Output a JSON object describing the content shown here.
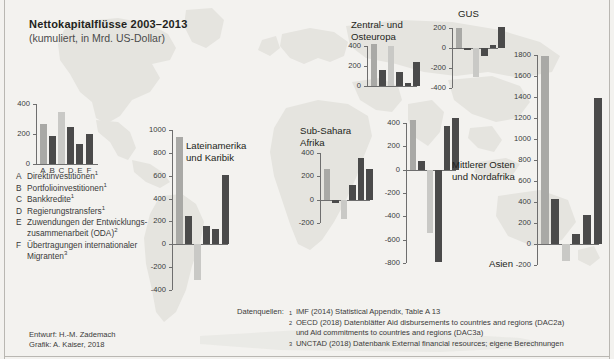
{
  "title": "Nettokapitalflüsse 2003–2013",
  "subtitle": "(kumuliert, in Mrd. US-Dollar)",
  "colors": {
    "bar_gray": "#a9a9a6",
    "bar_dark": "#4a4a4a",
    "bar_light": "#c9c9c6",
    "axis": "#6e6e6e",
    "background": "#f3f2ef",
    "map": "#e4e3de",
    "text": "#231f20"
  },
  "legend": {
    "categories": [
      "A",
      "B",
      "C",
      "D",
      "E",
      "F"
    ],
    "items": [
      {
        "key": "A",
        "label": "Direktinvestitionen",
        "note": "1"
      },
      {
        "key": "B",
        "label": "Portfolioinvestitionen",
        "note": "1"
      },
      {
        "key": "C",
        "label": "Bankkredite",
        "note": "1"
      },
      {
        "key": "D",
        "label": "Regierungstransfers",
        "note": "1"
      },
      {
        "key": "E",
        "label": "Zuwendungen der Entwicklungs-",
        "label2": "zusammenarbeit (ODA)",
        "note": "2"
      },
      {
        "key": "F",
        "label": "Übertragungen internationaler",
        "label2": "Migranten",
        "note": "3"
      }
    ]
  },
  "credits": {
    "line1": "Entwurf: H.-M. Zademach",
    "line2": "Grafik: A. Kaiser, 2018"
  },
  "sources": {
    "label": "Datenquellen:",
    "items": [
      {
        "num": "1",
        "text": "IMF (2014) Statistical Appendix, Table A 13"
      },
      {
        "num": "2",
        "text": "OECD (2018) Datenblätter Aid disbursements to countries and regions (DAC2a)",
        "cont": "und Aid commitments to countries and regions (DAC3a)"
      },
      {
        "num": "3",
        "text": "UNCTAD (2018) Datenbank External financial resources; eigene Berechnungen"
      }
    ]
  },
  "chart_data": [
    {
      "id": "legend-key-chart",
      "type": "bar",
      "title": "",
      "categories": [
        "A",
        "B",
        "C",
        "D",
        "E",
        "F"
      ],
      "values": [
        265,
        190,
        345,
        245,
        135,
        200
      ],
      "series_colors": [
        "bar_gray",
        "bar_dark",
        "bar_light",
        "bar_dark",
        "bar_dark",
        "bar_dark"
      ],
      "ylim": [
        0,
        400
      ],
      "yticks": [
        0,
        200,
        400
      ],
      "ylabel": "",
      "xlabel": "",
      "show_categories": true
    },
    {
      "id": "lateinamerika",
      "type": "bar",
      "title": "Lateinamerika",
      "title2": "und Karibik",
      "categories": [
        "A",
        "B",
        "C",
        "D",
        "E",
        "F"
      ],
      "values": [
        940,
        250,
        -310,
        160,
        130,
        605
      ],
      "series_colors": [
        "bar_gray",
        "bar_dark",
        "bar_light",
        "bar_dark",
        "bar_dark",
        "bar_dark"
      ],
      "ylim": [
        -400,
        1000
      ],
      "yticks": [
        -400,
        -200,
        0,
        200,
        400,
        600,
        800,
        1000
      ],
      "show_categories": false
    },
    {
      "id": "sub-sahara-afrika",
      "type": "bar",
      "title": "Sub-Sahara",
      "title2": "Afrika",
      "categories": [
        "A",
        "B",
        "C",
        "D",
        "E",
        "F"
      ],
      "values": [
        265,
        -25,
        -165,
        130,
        360,
        260
      ],
      "series_colors": [
        "bar_gray",
        "bar_dark",
        "bar_light",
        "bar_dark",
        "bar_dark",
        "bar_dark"
      ],
      "ylim": [
        -200,
        400
      ],
      "yticks": [
        -200,
        0,
        200,
        400
      ],
      "show_categories": false
    },
    {
      "id": "zentral-und-osteuropa",
      "type": "bar",
      "title": "Zentral- und",
      "title2": "Osteuropa",
      "categories": [
        "A",
        "B",
        "C",
        "D",
        "E",
        "F"
      ],
      "values": [
        425,
        165,
        405,
        145,
        30,
        245
      ],
      "series_colors": [
        "bar_gray",
        "bar_dark",
        "bar_light",
        "bar_dark",
        "bar_dark",
        "bar_dark"
      ],
      "ylim": [
        0,
        400
      ],
      "yticks": [
        0,
        200,
        400
      ],
      "show_categories": false
    },
    {
      "id": "gus",
      "type": "bar",
      "title": "GUS",
      "categories": [
        "A",
        "B",
        "C",
        "D",
        "E",
        "F"
      ],
      "values": [
        200,
        -20,
        -290,
        -75,
        30,
        215
      ],
      "series_colors": [
        "bar_gray",
        "bar_dark",
        "bar_light",
        "bar_dark",
        "bar_dark",
        "bar_dark"
      ],
      "ylim": [
        -400,
        200
      ],
      "yticks": [
        -400,
        -200,
        0,
        200
      ],
      "show_categories": false
    },
    {
      "id": "mittlerer-osten-und-nordafrika",
      "type": "bar",
      "title": "Mittlerer Osten",
      "title2": "und Nordafrika",
      "categories": [
        "A",
        "B",
        "C",
        "D",
        "E",
        "F"
      ],
      "values": [
        430,
        75,
        -545,
        -790,
        375,
        440
      ],
      "series_colors": [
        "bar_gray",
        "bar_dark",
        "bar_light",
        "bar_dark",
        "bar_dark",
        "bar_dark"
      ],
      "ylim": [
        -800,
        400
      ],
      "yticks": [
        -800,
        -600,
        -400,
        -200,
        0,
        200,
        400
      ],
      "show_categories": false
    },
    {
      "id": "asien",
      "type": "bar",
      "title": "Asien",
      "categories": [
        "A",
        "B",
        "C",
        "D",
        "E",
        "F"
      ],
      "values": [
        1790,
        430,
        -165,
        95,
        280,
        1395
      ],
      "series_colors": [
        "bar_gray",
        "bar_dark",
        "bar_light",
        "bar_dark",
        "bar_dark",
        "bar_dark"
      ],
      "ylim": [
        -200,
        1800
      ],
      "yticks": [
        -200,
        0,
        200,
        400,
        600,
        800,
        1000,
        1200,
        1400,
        1600,
        1800
      ],
      "show_categories": false
    }
  ],
  "chart_layout": {
    "legend-key-chart": {
      "x": 36,
      "y": 104,
      "w": 62,
      "h": 60,
      "barw": 7,
      "gap": 2.2,
      "labelpos": "none"
    },
    "lateinamerika": {
      "x": 172,
      "y": 130,
      "w": 56,
      "h": 160,
      "barw": 7,
      "gap": 2.2,
      "labelpos": "right",
      "lx": 14,
      "ly": 10
    },
    "sub-sahara-afrika": {
      "x": 320,
      "y": 153,
      "w": 50,
      "h": 70,
      "barw": 6.5,
      "gap": 2.0,
      "labelpos": "above",
      "lx": -20,
      "ly": -28
    },
    "zentral-und-osteuropa": {
      "x": 367,
      "y": 46,
      "w": 50,
      "h": 40,
      "barw": 6.5,
      "gap": 2.0,
      "labelpos": "above",
      "lx": -16,
      "ly": -27
    },
    "gus": {
      "x": 452,
      "y": 28,
      "w": 46,
      "h": 60,
      "barw": 6.5,
      "gap": 2.0,
      "labelpos": "above",
      "lx": 6,
      "ly": -20
    },
    "mittlerer-osten-und-nordafrika": {
      "x": 406,
      "y": 123,
      "w": 50,
      "h": 140,
      "barw": 6.5,
      "gap": 2.0,
      "labelpos": "right",
      "lx": 46,
      "ly": 36
    },
    "asien": {
      "x": 537,
      "y": 55,
      "w": 62,
      "h": 210,
      "barw": 8,
      "gap": 2.6,
      "labelpos": "left",
      "lx": -48,
      "ly": 203
    }
  }
}
